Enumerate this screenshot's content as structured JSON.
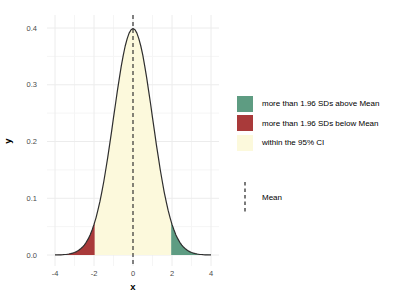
{
  "chart_data": {
    "type": "area",
    "title": "",
    "xlabel": "x",
    "ylabel": "y",
    "xlim": [
      -4.4,
      4.4
    ],
    "ylim": [
      -0.02,
      0.419
    ],
    "x_ticks": [
      -4,
      -2,
      0,
      2,
      4
    ],
    "y_ticks": [
      0.0,
      0.1,
      0.2,
      0.3,
      0.4
    ],
    "grid": "very light major and minor gridlines, white background",
    "legend_position": "right",
    "curve": {
      "name": "standard normal density",
      "x_start": -4,
      "x_step": 0.1,
      "y": [
        0.0001,
        0.0002,
        0.0003,
        0.0004,
        0.0006,
        0.0009,
        0.0012,
        0.0017,
        0.0024,
        0.0033,
        0.0044,
        0.006,
        0.0079,
        0.0104,
        0.0136,
        0.0175,
        0.0224,
        0.0283,
        0.0355,
        0.044,
        0.054,
        0.0656,
        0.079,
        0.094,
        0.1109,
        0.1295,
        0.1497,
        0.1714,
        0.1942,
        0.2179,
        0.242,
        0.2661,
        0.2897,
        0.3123,
        0.3332,
        0.3521,
        0.3683,
        0.3814,
        0.391,
        0.397,
        0.3989,
        0.397,
        0.391,
        0.3814,
        0.3683,
        0.3521,
        0.3332,
        0.3123,
        0.2897,
        0.2661,
        0.242,
        0.2179,
        0.1942,
        0.1714,
        0.1497,
        0.1295,
        0.1109,
        0.094,
        0.079,
        0.0656,
        0.054,
        0.044,
        0.0355,
        0.0283,
        0.0224,
        0.0175,
        0.0136,
        0.0104,
        0.0079,
        0.006,
        0.0044,
        0.0033,
        0.0024,
        0.0017,
        0.0012,
        0.0009,
        0.0006,
        0.0004,
        0.0003,
        0.0002,
        0.0001
      ],
      "line_color": "#2e2e2e",
      "peak_value": 0.3989
    },
    "regions": [
      {
        "label": "more than 1.96 SDs below Mean",
        "x_from": -4.0,
        "x_to": -1.96,
        "fill": "#A93A3A"
      },
      {
        "label": "within the 95% CI",
        "x_from": -1.96,
        "x_to": 1.96,
        "fill": "#FCF9DC"
      },
      {
        "label": "more than 1.96 SDs above Mean",
        "x_from": 1.96,
        "x_to": 4.0,
        "fill": "#5E9C82"
      }
    ],
    "mean_line": {
      "x": 0,
      "style": "dashed",
      "color": "#333333",
      "label": "Mean"
    }
  },
  "axes": {
    "x_title": "x",
    "y_title": "y",
    "x_tick_labels": [
      "-4",
      "-2",
      "0",
      "2",
      "4"
    ],
    "y_tick_labels": [
      "0.0",
      "0.1",
      "0.2",
      "0.3",
      "0.4"
    ],
    "tick_color": "#4a4a4a",
    "grid_major_color": "#ececec",
    "grid_minor_color": "#f5f5f5"
  },
  "legend": {
    "fill_items": [
      {
        "label": "more than 1.96 SDs above Mean",
        "color": "#5E9C82"
      },
      {
        "label": "more than 1.96 SDs below Mean",
        "color": "#A93A3A"
      },
      {
        "label": "within the 95% CI",
        "color": "#FCF9DC"
      }
    ],
    "line_items": [
      {
        "label": "Mean",
        "style": "dashed",
        "color": "#333333"
      }
    ]
  }
}
